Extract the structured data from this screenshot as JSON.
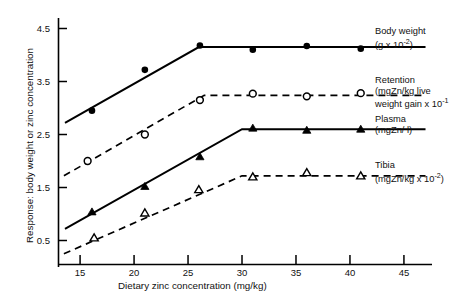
{
  "chart_data": {
    "type": "line",
    "title": "",
    "xlabel": "Dietary zinc concentration (mg/kg)",
    "ylabel": "Response: body weight or zinc concentration",
    "xlim": [
      13,
      47
    ],
    "ylim": [
      0,
      5.0
    ],
    "xticks": [
      15,
      20,
      25,
      30,
      35,
      40,
      45
    ],
    "yticks": [
      0.5,
      1.5,
      2.5,
      3.5,
      4.5
    ],
    "grid": false,
    "legend_position": "right",
    "series": [
      {
        "name": "Body weight",
        "unit": "(g x 10",
        "unit_exp": "-2",
        "unit_tail": ")",
        "marker": "filled-circle",
        "linestyle": "solid",
        "breakpoint_x": 26.0,
        "plateau_y": 4.15,
        "x": [
          16.1,
          21.0,
          26.1,
          31.0,
          36.0,
          41.0
        ],
        "y": [
          2.95,
          3.72,
          4.18,
          4.1,
          4.17,
          4.12
        ],
        "fit_x": [
          13.6,
          26.0,
          47.0
        ],
        "fit_y": [
          2.72,
          4.15,
          4.15
        ]
      },
      {
        "name": "Retention",
        "unit": "(mgZn/kg live weight gain x 10",
        "unit_exp": "-1",
        "unit_tail": "",
        "marker": "open-circle",
        "linestyle": "dashed",
        "breakpoint_x": 26.5,
        "plateau_y": 3.24,
        "x": [
          15.7,
          21.0,
          26.1,
          31.0,
          36.0,
          41.0
        ],
        "y": [
          2.0,
          2.5,
          3.15,
          3.27,
          3.22,
          3.28
        ],
        "fit_x": [
          13.5,
          26.5,
          47.0
        ],
        "fit_y": [
          1.72,
          3.24,
          3.24
        ]
      },
      {
        "name": "Plasma",
        "unit": "(mgZn/ l)",
        "unit_exp": "",
        "unit_tail": "",
        "marker": "filled-triangle",
        "linestyle": "solid",
        "breakpoint_x": 30.0,
        "plateau_y": 2.6,
        "x": [
          16.1,
          21.0,
          26.1,
          31.0,
          36.0,
          41.0
        ],
        "y": [
          1.04,
          1.52,
          2.08,
          2.62,
          2.58,
          2.6
        ],
        "fit_x": [
          13.6,
          30.0,
          47.0
        ],
        "fit_y": [
          0.72,
          2.6,
          2.6
        ]
      },
      {
        "name": "Tibia",
        "unit": "(mgZn/kg x 10",
        "unit_exp": "-2",
        "unit_tail": ")",
        "marker": "open-triangle",
        "linestyle": "dashed",
        "breakpoint_x": 30.0,
        "plateau_y": 1.72,
        "x": [
          16.3,
          21.0,
          26.0,
          31.0,
          36.0,
          41.0
        ],
        "y": [
          0.55,
          1.02,
          1.46,
          1.7,
          1.78,
          1.72
        ],
        "fit_x": [
          13.5,
          30.0,
          47.0
        ],
        "fit_y": [
          0.25,
          1.72,
          1.72
        ]
      }
    ]
  },
  "axis": {
    "x_label": "Dietary zinc concentration (mg/kg)",
    "y_label": "Response: body weight or zinc concentration",
    "x_ticks": [
      "15",
      "20",
      "25",
      "30",
      "35",
      "40",
      "45"
    ],
    "y_ticks": [
      "4.5",
      "3.5",
      "2.5",
      "1.5",
      "0.5"
    ]
  },
  "legend": [
    {
      "name": "Body weight",
      "line1": "Body weight",
      "line2": "(g x 10",
      "exp": "-2",
      "tail": ")"
    },
    {
      "name": "Retention",
      "line1": "Retention",
      "line2": "(mgZn/kg live",
      "line3": "weight gain x 10",
      "exp": "-1",
      "tail": ""
    },
    {
      "name": "Plasma",
      "line1": "Plasma",
      "line2": "(mgZn/ l)",
      "exp": "",
      "tail": ""
    },
    {
      "name": "Tibia",
      "line1": "Tibia",
      "line2": "(mgZn/kg x 10",
      "exp": "-2",
      "tail": ")"
    }
  ],
  "colors": {
    "ink": "#000000",
    "background": "#ffffff"
  }
}
